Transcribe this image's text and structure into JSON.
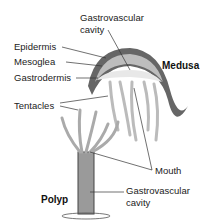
{
  "diagram": {
    "labels": {
      "gastro_top_line1": "Gastrovascular",
      "gastro_top_line2": "cavity",
      "epidermis": "Epidermis",
      "mesoglea": "Mesoglea",
      "gastrodermis": "Gastrodermis",
      "medusa": "Medusa",
      "tentacles": "Tentacles",
      "mouth": "Mouth",
      "polyp": "Polyp",
      "gastro_bottom_line1": "Gastrovascular",
      "gastro_bottom_line2": "cavity"
    },
    "colors": {
      "outer": "#555555",
      "mid": "#8a8a8a",
      "light": "#d4d4d4",
      "line": "#333333"
    }
  }
}
